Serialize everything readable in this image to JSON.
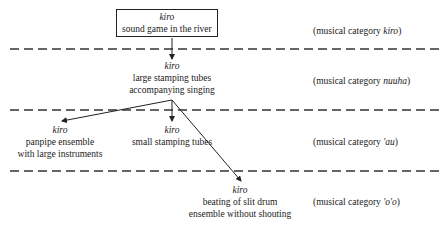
{
  "diagram": {
    "root": {
      "term": "kiro",
      "desc": "sound game in the river"
    },
    "level2": {
      "term": "kiro",
      "line1": "large stamping tubes",
      "line2": "accompanying singing"
    },
    "level3a": {
      "term": "kiro",
      "line1": "panpipe ensemble",
      "line2": "with large instruments"
    },
    "level3b": {
      "term": "kiro",
      "line1": "small stamping tubes"
    },
    "level4": {
      "term": "kiro",
      "line1": "beating of slit drum",
      "line2": "ensemble without shouting"
    },
    "categories": [
      {
        "prefix": "(musical category ",
        "name": "kiro",
        "suffix": ")"
      },
      {
        "prefix": "(musical category ",
        "name": "nuuha",
        "suffix": ")"
      },
      {
        "prefix": "(musical category ",
        "name": "'au",
        "suffix": ")"
      },
      {
        "prefix": "(musical category ",
        "name": "'o'o",
        "suffix": ")"
      }
    ]
  }
}
